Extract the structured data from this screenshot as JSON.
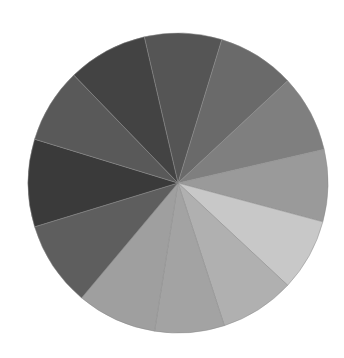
{
  "chart_data": {
    "type": "pie",
    "title": "",
    "center": [
      178,
      183
    ],
    "radius": 150,
    "slices": [
      {
        "start_deg": -103,
        "end_deg": -73,
        "value": 30,
        "color": "#555555"
      },
      {
        "start_deg": -73,
        "end_deg": -43,
        "value": 30,
        "color": "#6a6a6a"
      },
      {
        "start_deg": -43,
        "end_deg": -13,
        "value": 30,
        "color": "#7f7f7f"
      },
      {
        "start_deg": -13,
        "end_deg": 15,
        "value": 28,
        "color": "#9a9a9a"
      },
      {
        "start_deg": 15,
        "end_deg": 43,
        "value": 28,
        "color": "#c8c8c8"
      },
      {
        "start_deg": 43,
        "end_deg": 72,
        "value": 29,
        "color": "#b0b0b0"
      },
      {
        "start_deg": 72,
        "end_deg": 99,
        "value": 27,
        "color": "#a3a3a3"
      },
      {
        "start_deg": 99,
        "end_deg": 130,
        "value": 31,
        "color": "#9f9f9f"
      },
      {
        "start_deg": 130,
        "end_deg": 163,
        "value": 33,
        "color": "#5e5e5e"
      },
      {
        "start_deg": 163,
        "end_deg": 197,
        "value": 34,
        "color": "#3a3a3a"
      },
      {
        "start_deg": 197,
        "end_deg": 226,
        "value": 29,
        "color": "#595959"
      },
      {
        "start_deg": 226,
        "end_deg": 257,
        "value": 31,
        "color": "#434343"
      }
    ]
  }
}
